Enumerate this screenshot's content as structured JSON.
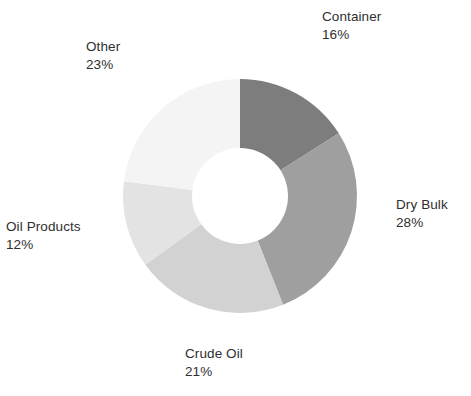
{
  "chart_data": {
    "type": "pie",
    "variant": "donut",
    "title": "",
    "subtitle": "",
    "xlabel": "",
    "ylabel": "",
    "grid": false,
    "legend_position": "none",
    "label_format": "name + percent",
    "units": "percent",
    "total": 100,
    "start_angle_deg": 0,
    "direction": "clockwise",
    "inner_radius_ratio": 0.41,
    "categories": [
      "Container",
      "Dry Bulk",
      "Crude Oil",
      "Oil Products",
      "Other"
    ],
    "values": [
      16,
      28,
      21,
      12,
      23
    ],
    "slices": [
      {
        "name": "Container",
        "value": 16,
        "percent_text": "16%",
        "color": "#7d7d7d"
      },
      {
        "name": "Dry Bulk",
        "value": 28,
        "percent_text": "28%",
        "color": "#9f9f9f"
      },
      {
        "name": "Crude Oil",
        "value": 21,
        "percent_text": "21%",
        "color": "#d2d2d2"
      },
      {
        "name": "Oil Products",
        "value": 12,
        "percent_text": "12%",
        "color": "#e3e3e3"
      },
      {
        "name": "Other",
        "value": 23,
        "percent_text": "23%",
        "color": "#f4f4f4"
      }
    ]
  },
  "labels": {
    "container": {
      "name": "Container",
      "value": "16%"
    },
    "dry_bulk": {
      "name": "Dry Bulk",
      "value": "28%"
    },
    "crude_oil": {
      "name": "Crude Oil",
      "value": "21%"
    },
    "oil_products": {
      "name": "Oil Products",
      "value": "12%"
    },
    "other": {
      "name": "Other",
      "value": "23%"
    }
  },
  "colors": {
    "background": "#ffffff",
    "text": "#2e2e2e",
    "container": "#7d7d7d",
    "dry_bulk": "#9f9f9f",
    "crude_oil": "#d2d2d2",
    "oil_products": "#e3e3e3",
    "other": "#f4f4f4",
    "donut_hole": "#ffffff"
  }
}
